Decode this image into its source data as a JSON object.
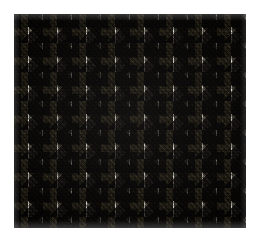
{
  "image": {
    "subject": "houndstooth-woven-fabric-swatch",
    "description": "Close-up photograph of a black-and-white houndstooth (dogtooth / pied-de-poule) woven textile",
    "canvas_width": 260,
    "canvas_height": 242,
    "background_color": "#ffffff",
    "alt_text": "Black and white houndstooth check fabric texture"
  },
  "swatch": {
    "left": 14,
    "top": 14,
    "width": 232,
    "height": 214,
    "pattern_name": "houndstooth",
    "weave": "twill",
    "repeat_period_px": 29,
    "twill_angle_deg": 48,
    "colors": {
      "dark_yarn": "#17150f",
      "light_yarn": "#efece6",
      "midtone": "#8b887f",
      "plate_background": "#ffffff"
    },
    "tonal_range": {
      "darkest": "#0d0c08",
      "lightest": "#f6f4ef",
      "mean": "#8a877e"
    }
  },
  "layers": [
    {
      "name": "houndstooth-base",
      "role": "pattern"
    },
    {
      "name": "houndstooth-offset",
      "role": "pattern"
    },
    {
      "name": "houndstooth-teeth",
      "role": "pattern"
    },
    {
      "name": "twill-weft-rib",
      "role": "texture"
    },
    {
      "name": "twill-warp-rib",
      "role": "texture"
    },
    {
      "name": "yarn-speckle",
      "role": "texture"
    },
    {
      "name": "weft-banding",
      "role": "texture"
    },
    {
      "name": "photographic-blur",
      "role": "finish"
    },
    {
      "name": "vignette",
      "role": "finish"
    },
    {
      "name": "edge-fade",
      "role": "finish"
    }
  ]
}
